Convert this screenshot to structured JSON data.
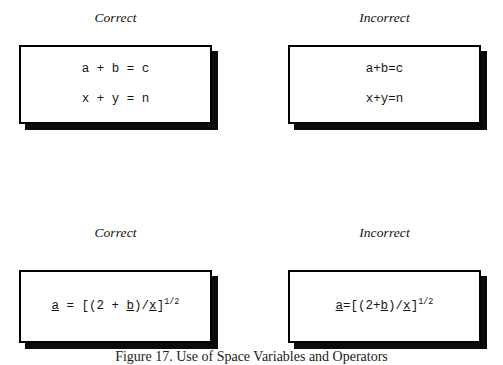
{
  "figure": {
    "caption": "Figure 17. Use of Space Variables and Operators",
    "panels": [
      {
        "id": "top-left",
        "label": "Correct",
        "kind": "correct",
        "lines": [
          {
            "segments": [
              {
                "text": "a + b = c",
                "style": "plain"
              }
            ]
          },
          {
            "segments": [
              {
                "text": "x + y = n",
                "style": "plain"
              }
            ]
          }
        ]
      },
      {
        "id": "top-right",
        "label": "Incorrect",
        "kind": "incorrect",
        "lines": [
          {
            "segments": [
              {
                "text": "a+b=c",
                "style": "plain"
              }
            ]
          },
          {
            "segments": [
              {
                "text": "x+y=n",
                "style": "plain"
              }
            ]
          }
        ]
      },
      {
        "id": "bottom-left",
        "label": "Correct",
        "kind": "correct",
        "lines": [
          {
            "segments": [
              {
                "text": "a",
                "style": "var"
              },
              {
                "text": " = [(2 + ",
                "style": "plain"
              },
              {
                "text": "b",
                "style": "var"
              },
              {
                "text": ")/",
                "style": "plain"
              },
              {
                "text": "x",
                "style": "var"
              },
              {
                "text": "]",
                "style": "plain"
              },
              {
                "text": "1/2",
                "style": "sup"
              }
            ]
          }
        ]
      },
      {
        "id": "bottom-right",
        "label": "Incorrect",
        "kind": "incorrect",
        "lines": [
          {
            "segments": [
              {
                "text": "a",
                "style": "var"
              },
              {
                "text": "=[(2+",
                "style": "plain"
              },
              {
                "text": "b",
                "style": "var"
              },
              {
                "text": ")/",
                "style": "plain"
              },
              {
                "text": "x",
                "style": "var"
              },
              {
                "text": "]",
                "style": "plain"
              },
              {
                "text": "1/2",
                "style": "sup"
              }
            ]
          }
        ]
      }
    ]
  },
  "colors": {
    "background": "#ffffff",
    "border": "#000000",
    "shadow": "#0b0b0b",
    "text": "#151515"
  }
}
